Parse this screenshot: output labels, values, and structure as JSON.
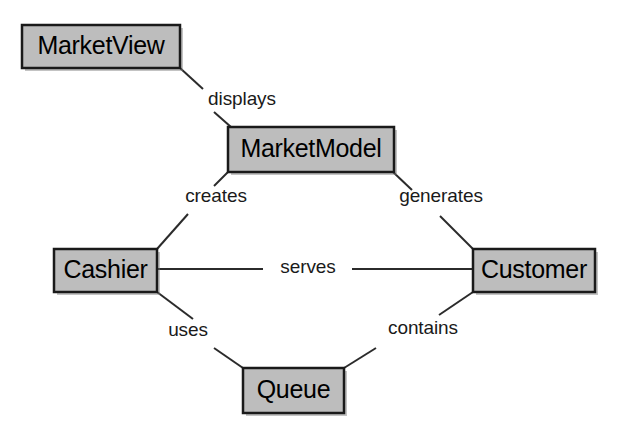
{
  "diagram": {
    "type": "uml-class-association-diagram",
    "canvas": {
      "width": 623,
      "height": 444,
      "background": "#ffffff"
    },
    "style": {
      "node_fill": "#bdbdbd",
      "node_stroke": "#1a1a1a",
      "node_stroke_width": 2.5,
      "line_stroke": "#2b2b2b",
      "line_stroke_width": 2,
      "label_color": "#000000",
      "relation_label_color": "#1a1a1a"
    },
    "nodes": [
      {
        "id": "marketview",
        "label": "MarketView",
        "x": 22,
        "y": 25,
        "w": 158,
        "h": 43,
        "font_size": 25
      },
      {
        "id": "marketmodel",
        "label": "MarketModel",
        "x": 228,
        "y": 127,
        "w": 166,
        "h": 45,
        "font_size": 25
      },
      {
        "id": "cashier",
        "label": "Cashier",
        "x": 54,
        "y": 249,
        "w": 103,
        "h": 43,
        "font_size": 25
      },
      {
        "id": "customer",
        "label": "Customer",
        "x": 473,
        "y": 249,
        "w": 122,
        "h": 43,
        "font_size": 25
      },
      {
        "id": "queue",
        "label": "Queue",
        "x": 243,
        "y": 368,
        "w": 101,
        "h": 45,
        "font_size": 25
      }
    ],
    "relations": [
      {
        "id": "displays",
        "label": "displays",
        "from": "marketview",
        "to": "marketmodel",
        "label_x": 242,
        "label_y": 100,
        "segments": [
          {
            "x1": 180,
            "y1": 68,
            "x2": 203,
            "y2": 89
          },
          {
            "x1": 214,
            "y1": 112,
            "x2": 231,
            "y2": 127
          }
        ]
      },
      {
        "id": "creates",
        "label": "creates",
        "from": "marketmodel",
        "to": "cashier",
        "label_x": 216,
        "label_y": 197,
        "segments": [
          {
            "x1": 228,
            "y1": 172,
            "x2": 214,
            "y2": 186
          },
          {
            "x1": 188,
            "y1": 214,
            "x2": 157,
            "y2": 249
          }
        ]
      },
      {
        "id": "generates",
        "label": "generates",
        "from": "marketmodel",
        "to": "customer",
        "label_x": 441,
        "label_y": 197,
        "segments": [
          {
            "x1": 393,
            "y1": 172,
            "x2": 412,
            "y2": 190
          },
          {
            "x1": 440,
            "y1": 216,
            "x2": 473,
            "y2": 249
          }
        ]
      },
      {
        "id": "serves",
        "label": "serves",
        "from": "cashier",
        "to": "customer",
        "label_x": 308,
        "label_y": 268,
        "segments": [
          {
            "x1": 157,
            "y1": 269,
            "x2": 263,
            "y2": 269
          },
          {
            "x1": 352,
            "y1": 269,
            "x2": 473,
            "y2": 269
          }
        ]
      },
      {
        "id": "uses",
        "label": "uses",
        "from": "cashier",
        "to": "queue",
        "label_x": 188,
        "label_y": 331,
        "segments": [
          {
            "x1": 157,
            "y1": 292,
            "x2": 193,
            "y2": 319
          },
          {
            "x1": 214,
            "y1": 348,
            "x2": 243,
            "y2": 368
          }
        ]
      },
      {
        "id": "contains",
        "label": "contains",
        "from": "customer",
        "to": "queue",
        "label_x": 423,
        "label_y": 329,
        "segments": [
          {
            "x1": 473,
            "y1": 292,
            "x2": 439,
            "y2": 315
          },
          {
            "x1": 376,
            "y1": 348,
            "x2": 344,
            "y2": 368
          }
        ]
      }
    ]
  }
}
